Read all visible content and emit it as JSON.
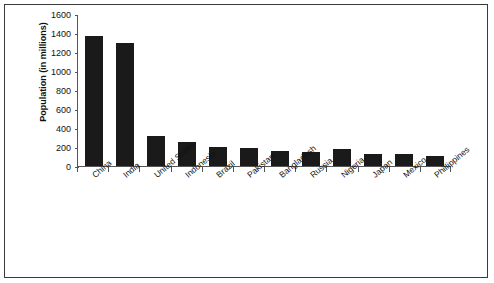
{
  "chart_data": {
    "type": "bar",
    "title": "",
    "xlabel": "",
    "ylabel": "Population (in millions)",
    "ylim": [
      0,
      1600
    ],
    "ytick_labels": [
      "1600",
      "1400",
      "1200",
      "1000",
      "800",
      "600",
      "400",
      "200",
      "0"
    ],
    "yticks": [
      1600,
      1400,
      1200,
      1000,
      800,
      600,
      400,
      200,
      0
    ],
    "grid": false,
    "legend": false,
    "bar_color": "#1a1a1a",
    "categories": [
      "China",
      "India",
      "United States",
      "Indonesia",
      "Brazil",
      "Pakistan",
      "Bangladesh",
      "Russia",
      "Nigeria",
      "Japan",
      "Mexico",
      "Phillippines"
    ],
    "values": [
      1370,
      1290,
      320,
      255,
      205,
      190,
      160,
      145,
      180,
      128,
      125,
      105
    ]
  }
}
